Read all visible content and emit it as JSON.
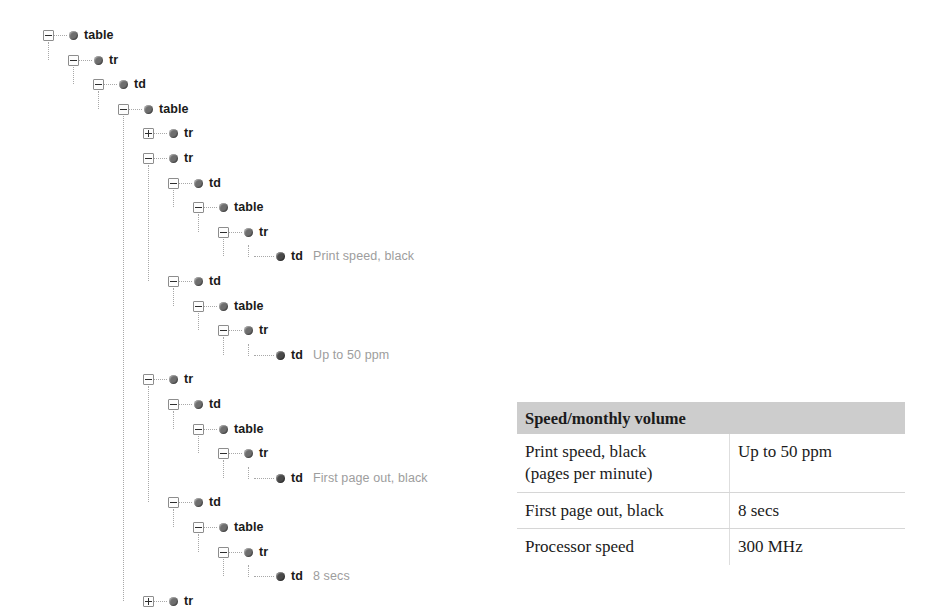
{
  "tree": {
    "nodes": [
      {
        "label": "table",
        "value": "",
        "depth": 0,
        "toggle": "minus",
        "leaf": false
      },
      {
        "label": "tr",
        "value": "",
        "depth": 1,
        "toggle": "minus",
        "leaf": false
      },
      {
        "label": "td",
        "value": "",
        "depth": 2,
        "toggle": "minus",
        "leaf": false
      },
      {
        "label": "table",
        "value": "",
        "depth": 3,
        "toggle": "minus",
        "leaf": false
      },
      {
        "label": "tr",
        "value": "",
        "depth": 4,
        "toggle": "plus",
        "leaf": false
      },
      {
        "label": "tr",
        "value": "",
        "depth": 4,
        "toggle": "minus",
        "leaf": false
      },
      {
        "label": "td",
        "value": "",
        "depth": 5,
        "toggle": "minus",
        "leaf": false
      },
      {
        "label": "table",
        "value": "",
        "depth": 6,
        "toggle": "minus",
        "leaf": false
      },
      {
        "label": "tr",
        "value": "",
        "depth": 7,
        "toggle": "minus",
        "leaf": false
      },
      {
        "label": "td",
        "value": "Print speed, black",
        "depth": 8,
        "toggle": "none",
        "leaf": true
      },
      {
        "label": "td",
        "value": "",
        "depth": 5,
        "toggle": "minus",
        "leaf": false
      },
      {
        "label": "table",
        "value": "",
        "depth": 6,
        "toggle": "minus",
        "leaf": false
      },
      {
        "label": "tr",
        "value": "",
        "depth": 7,
        "toggle": "minus",
        "leaf": false
      },
      {
        "label": "td",
        "value": "Up to 50 ppm",
        "depth": 8,
        "toggle": "none",
        "leaf": true
      },
      {
        "label": "tr",
        "value": "",
        "depth": 4,
        "toggle": "minus",
        "leaf": false
      },
      {
        "label": "td",
        "value": "",
        "depth": 5,
        "toggle": "minus",
        "leaf": false
      },
      {
        "label": "table",
        "value": "",
        "depth": 6,
        "toggle": "minus",
        "leaf": false
      },
      {
        "label": "tr",
        "value": "",
        "depth": 7,
        "toggle": "minus",
        "leaf": false
      },
      {
        "label": "td",
        "value": "First page out, black",
        "depth": 8,
        "toggle": "none",
        "leaf": true
      },
      {
        "label": "td",
        "value": "",
        "depth": 5,
        "toggle": "minus",
        "leaf": false
      },
      {
        "label": "table",
        "value": "",
        "depth": 6,
        "toggle": "minus",
        "leaf": false
      },
      {
        "label": "tr",
        "value": "",
        "depth": 7,
        "toggle": "minus",
        "leaf": false
      },
      {
        "label": "td",
        "value": "8 secs",
        "depth": 8,
        "toggle": "none",
        "leaf": true
      },
      {
        "label": "tr",
        "value": "",
        "depth": 4,
        "toggle": "plus",
        "leaf": false
      }
    ],
    "colors": {
      "tag_text": "#1a1a1a",
      "value_text": "#9d9d9d",
      "bullet": "#6e6e6e",
      "guide_line": "#a8a8a8"
    }
  },
  "spec_table": {
    "header": "Speed/monthly volume",
    "columns": [
      "Speed/monthly volume",
      ""
    ],
    "rows": [
      {
        "label": "Print speed, black\n(pages per minute)",
        "label_line1": "Print speed, black",
        "label_line2": "(pages per minute)",
        "value": "Up to 50 ppm"
      },
      {
        "label": "First page out, black",
        "label_line1": "First page out, black",
        "label_line2": "",
        "value": "8 secs"
      },
      {
        "label": "Processor speed",
        "label_line1": "Processor speed",
        "label_line2": "",
        "value": "300 MHz"
      }
    ],
    "colors": {
      "header_bg": "#cdcdcd",
      "body_bg": "#ffffff",
      "rule": "#d6d6d6",
      "text": "#1b1b1b"
    }
  }
}
